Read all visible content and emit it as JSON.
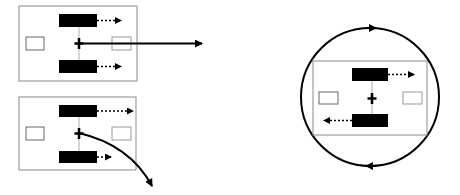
{
  "diagram": {
    "colors": {
      "stroke": "#000000",
      "frame": "#8a8a8a",
      "bar": "#000000",
      "background": "#ffffff"
    },
    "panels": [
      {
        "id": "translation",
        "motion": "straight-arrow-right"
      },
      {
        "id": "curved",
        "motion": "curved-arrow-down-right"
      },
      {
        "id": "rotation",
        "motion": "circular-arrow-clockwise"
      }
    ]
  }
}
